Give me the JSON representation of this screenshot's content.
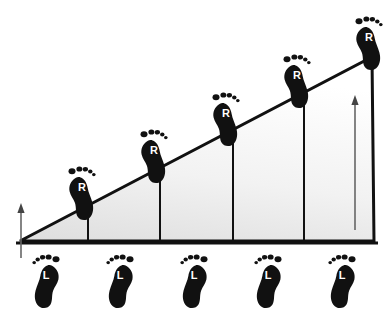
{
  "diagram": {
    "background_color": "#ffffff",
    "stroke_color": "#111111",
    "fill_light": "#ffffff",
    "fill_shade": "#e4e4e4",
    "arrow_color": "#555555",
    "label_color": "#ffffff",
    "width": 391,
    "height": 311
  },
  "ramp": {
    "name": "right-triangle-ramp",
    "apex_left": {
      "x": 20,
      "y": 241
    },
    "apex_top_right": {
      "x": 372,
      "y": 57
    },
    "base_right": {
      "x": 374,
      "y": 241
    },
    "baseline_left": {
      "x": 16,
      "y": 243
    },
    "baseline_right": {
      "x": 378,
      "y": 243
    },
    "stroke_width": 3
  },
  "dividers": {
    "name": "height-dividers",
    "label": "vertical height markers",
    "stroke_width": 2,
    "lines": [
      {
        "x": 88,
        "y_top": 206,
        "y_bottom": 242
      },
      {
        "x": 160,
        "y_top": 169,
        "y_bottom": 242
      },
      {
        "x": 233,
        "y_top": 131,
        "y_bottom": 242
      },
      {
        "x": 304,
        "y_top": 94,
        "y_bottom": 242
      }
    ]
  },
  "arrows": {
    "name": "height-arrows",
    "items": [
      {
        "name": "short-height-arrow",
        "label": "start height",
        "x": 21,
        "y_top": 206,
        "y_bottom": 258
      },
      {
        "name": "tall-height-arrow",
        "label": "end height",
        "x": 355,
        "y_top": 97,
        "y_bottom": 230
      }
    ]
  },
  "footprints": {
    "right_label": "R",
    "left_label": "L",
    "right_name": "right-footprint",
    "left_name": "left-footprint",
    "right_steps": [
      {
        "x": 62,
        "y": 167,
        "label": "R"
      },
      {
        "x": 134,
        "y": 130,
        "label": "R"
      },
      {
        "x": 206,
        "y": 93,
        "label": "R"
      },
      {
        "x": 277,
        "y": 55,
        "label": "R"
      },
      {
        "x": 349,
        "y": 17,
        "label": "R"
      }
    ],
    "left_steps": [
      {
        "x": 28,
        "y": 255,
        "label": "L"
      },
      {
        "x": 102,
        "y": 255,
        "label": "L"
      },
      {
        "x": 176,
        "y": 255,
        "label": "L"
      },
      {
        "x": 250,
        "y": 255,
        "label": "L"
      },
      {
        "x": 324,
        "y": 255,
        "label": "L"
      }
    ]
  }
}
